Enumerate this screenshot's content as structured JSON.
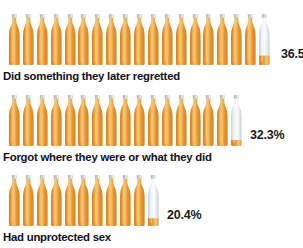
{
  "chart_data": {
    "type": "bar",
    "subtype": "pictogram-isotype",
    "title": "",
    "subtitle": "",
    "xlabel": "",
    "ylabel": "",
    "unit": "%",
    "icon": "beer-bottle-icon",
    "icon_value": 2,
    "icon_value_note": "each bottle icon represents 2 percent",
    "categories": [
      "Did something they later regretted",
      "Forgot where they were or what they did",
      "Had unprotected sex"
    ],
    "values": [
      36.5,
      32.3,
      20.4
    ],
    "value_labels": [
      "36.5",
      "32.3%",
      "20.4%"
    ],
    "ylim": [
      0,
      40
    ],
    "grid": false,
    "legend": null
  },
  "rows": [
    {
      "label": "Did something they later regretted",
      "value_label": "36.5",
      "value": 36.5,
      "full_icons": 18,
      "partial_icon_fill": 0.25,
      "value_label_left": 281,
      "pictogram_left": 8
    },
    {
      "label": "Forgot where they were or what they did",
      "value_label": "32.3%",
      "value": 32.3,
      "full_icons": 16,
      "partial_icon_fill": 0.15,
      "value_label_left": 250,
      "pictogram_left": 8
    },
    {
      "label": "Had unprotected sex",
      "value_label": "20.4%",
      "value": 20.4,
      "full_icons": 10,
      "partial_icon_fill": 0.2,
      "value_label_left": 167,
      "pictogram_left": 8
    }
  ],
  "colors": {
    "bottle_amber_light": "#f7c878",
    "bottle_amber": "#e9962f",
    "bottle_amber_dark": "#d8821c",
    "bottle_empty": "#e8eef1",
    "bottle_empty_edge": "#c6d2d8",
    "cap": "#cfd3d6",
    "label_text": "#111122",
    "value_text": "#1a1a1a",
    "background": "#ffffff"
  }
}
